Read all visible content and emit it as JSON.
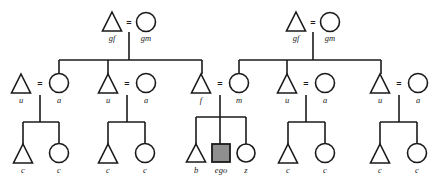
{
  "diagram": {
    "background_color": "#ffffff",
    "line_color": "#1a1a1a",
    "ego_fill_color": "#8f8f8f",
    "symbol_fill_color": "#ffffff",
    "marriage_symbol": "=",
    "generations": [
      {
        "name": "grandparents",
        "persons": [
          {
            "id": "gf-left",
            "label": "gf",
            "shape": "triangle",
            "cx": 112,
            "cy": 22
          },
          {
            "id": "gm-left",
            "label": "gm",
            "shape": "circle",
            "cx": 146,
            "cy": 22
          },
          {
            "id": "gf-right",
            "label": "gf",
            "shape": "triangle",
            "cx": 296,
            "cy": 22
          },
          {
            "id": "gm-right",
            "label": "gm",
            "shape": "circle",
            "cx": 330,
            "cy": 22
          }
        ]
      },
      {
        "name": "parents",
        "persons": [
          {
            "id": "u1",
            "label": "u",
            "shape": "triangle",
            "cx": 21,
            "cy": 83
          },
          {
            "id": "a1",
            "label": "a",
            "shape": "circle",
            "cx": 59,
            "cy": 83
          },
          {
            "id": "u2",
            "label": "u",
            "shape": "triangle",
            "cx": 108,
            "cy": 83
          },
          {
            "id": "a2",
            "label": "a",
            "shape": "circle",
            "cx": 146,
            "cy": 83
          },
          {
            "id": "f",
            "label": "f",
            "shape": "triangle",
            "cx": 201,
            "cy": 83
          },
          {
            "id": "m",
            "label": "m",
            "shape": "circle",
            "cx": 239,
            "cy": 83
          },
          {
            "id": "u3",
            "label": "u",
            "shape": "triangle",
            "cx": 287,
            "cy": 83
          },
          {
            "id": "a3",
            "label": "a",
            "shape": "circle",
            "cx": 325,
            "cy": 83
          },
          {
            "id": "u4",
            "label": "u",
            "shape": "triangle",
            "cx": 380,
            "cy": 83
          },
          {
            "id": "a4",
            "label": "a",
            "shape": "circle",
            "cx": 418,
            "cy": 83
          }
        ]
      },
      {
        "name": "children",
        "persons": [
          {
            "id": "c1",
            "label": "c",
            "shape": "triangle",
            "cx": 23,
            "cy": 153
          },
          {
            "id": "c2",
            "label": "c",
            "shape": "circle",
            "cx": 59,
            "cy": 153
          },
          {
            "id": "c3",
            "label": "c",
            "shape": "triangle",
            "cx": 108,
            "cy": 153
          },
          {
            "id": "c4",
            "label": "c",
            "shape": "circle",
            "cx": 145,
            "cy": 153
          },
          {
            "id": "b",
            "label": "b",
            "shape": "triangle",
            "cx": 196,
            "cy": 153
          },
          {
            "id": "ego",
            "label": "ego",
            "shape": "square",
            "cx": 221,
            "cy": 153
          },
          {
            "id": "z",
            "label": "z",
            "shape": "circle",
            "cx": 246,
            "cy": 153
          },
          {
            "id": "c5",
            "label": "c",
            "shape": "triangle",
            "cx": 288,
            "cy": 153
          },
          {
            "id": "c6",
            "label": "c",
            "shape": "circle",
            "cx": 325,
            "cy": 153
          },
          {
            "id": "c7",
            "label": "c",
            "shape": "triangle",
            "cx": 380,
            "cy": 153
          },
          {
            "id": "c8",
            "label": "c",
            "shape": "circle",
            "cx": 417,
            "cy": 153
          }
        ]
      }
    ],
    "marriages": [
      {
        "id": "m-gp-left",
        "eq_x": 129,
        "eq_y": 22
      },
      {
        "id": "m-gp-right",
        "eq_x": 313,
        "eq_y": 22
      },
      {
        "id": "m-u1-a1",
        "eq_x": 40,
        "eq_y": 83
      },
      {
        "id": "m-u2-a2",
        "eq_x": 127,
        "eq_y": 83
      },
      {
        "id": "m-f-m",
        "eq_x": 220,
        "eq_y": 83
      },
      {
        "id": "m-u3-a3",
        "eq_x": 306,
        "eq_y": 83
      },
      {
        "id": "m-u4-a4",
        "eq_x": 399,
        "eq_y": 83
      }
    ]
  }
}
